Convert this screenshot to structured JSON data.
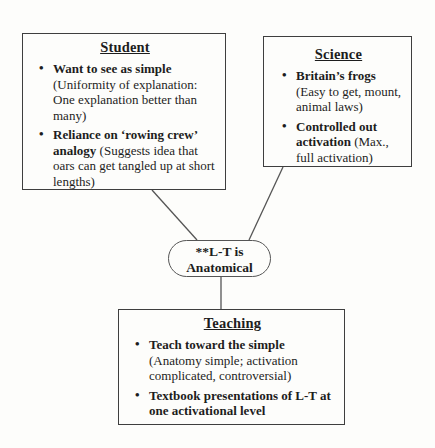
{
  "colors": {
    "paper": "#fdfdfb",
    "ink": "#1d1d1d",
    "border": "#3e3e3e",
    "line": "#555555"
  },
  "glyphs": {
    "bullet": "•"
  },
  "nodes": {
    "student": {
      "title": "Student",
      "bullets": [
        {
          "bold": "Want to see as simple",
          "rest": " (Uniformity of explanation: One explanation better than many)"
        },
        {
          "bold": "Reliance on ‘rowing crew’ analogy",
          "rest": " (Suggests idea that oars can get tangled up at short lengths)"
        }
      ]
    },
    "science": {
      "title": "Science",
      "bullets": [
        {
          "bold": "Britain’s frogs",
          "rest": " (Easy to get, mount, animal laws)"
        },
        {
          "bold": "Controlled out activation",
          "rest": " (Max., full activation)"
        }
      ]
    },
    "teaching": {
      "title": "Teaching",
      "bullets": [
        {
          "bold": "Teach toward the simple",
          "rest": " (Anatomy simple; activation complicated, controversial)"
        },
        {
          "bold": "Textbook presentations of L-T at one activational level",
          "rest": ""
        }
      ]
    },
    "center": {
      "line1": "**L-T is",
      "line2": "Anatomical"
    }
  },
  "connectors": [
    {
      "from": "student",
      "to": "center",
      "x1": 152,
      "y1": 190,
      "x2": 197,
      "y2": 240
    },
    {
      "from": "science",
      "to": "center",
      "x1": 283,
      "y1": 167,
      "x2": 249,
      "y2": 240
    },
    {
      "from": "center",
      "to": "teaching",
      "x1": 221,
      "y1": 276,
      "x2": 221,
      "y2": 309
    }
  ]
}
